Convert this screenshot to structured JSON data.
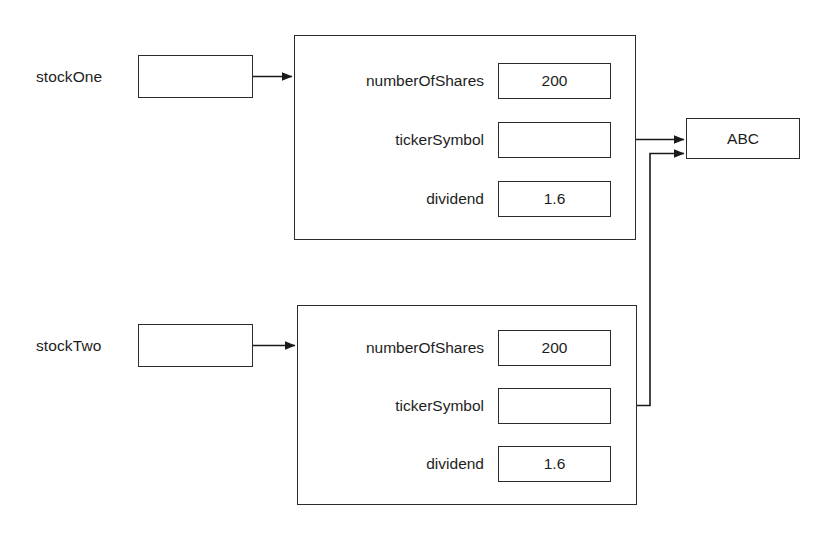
{
  "diagram": {
    "variables": [
      {
        "id": "stockOne",
        "label": "stockOne"
      },
      {
        "id": "stockTwo",
        "label": "stockTwo"
      }
    ],
    "objects": [
      {
        "id": "stock-object-one",
        "fields": [
          {
            "name": "numberOfShares",
            "value": "200"
          },
          {
            "name": "tickerSymbol",
            "value": ""
          },
          {
            "name": "dividend",
            "value": "1.6"
          }
        ]
      },
      {
        "id": "stock-object-two",
        "fields": [
          {
            "name": "numberOfShares",
            "value": "200"
          },
          {
            "name": "tickerSymbol",
            "value": ""
          },
          {
            "name": "dividend",
            "value": "1.6"
          }
        ]
      }
    ],
    "shared_string": {
      "id": "string-object-abc",
      "value": "ABC"
    },
    "colors": {
      "stroke": "#2b2b2b",
      "text": "#1d1d1d",
      "background": "#ffffff"
    },
    "connections": [
      {
        "from": "stockOne",
        "to": "stock-object-one"
      },
      {
        "from": "stockTwo",
        "to": "stock-object-two"
      },
      {
        "from": "stock-object-one.tickerSymbol",
        "to": "string-object-abc"
      },
      {
        "from": "stock-object-two.tickerSymbol",
        "to": "string-object-abc"
      }
    ]
  }
}
